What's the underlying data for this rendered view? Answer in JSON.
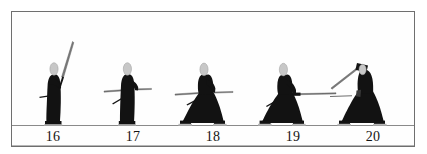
{
  "plate": {
    "title": "Kendo kata sequence plate",
    "frame_color": "#6f6f6f",
    "background_color": "#ffffff",
    "ground_line_color": "#8a8a8a",
    "figure_color": "#111111",
    "head_color": "#c9c9c9",
    "blade_color": "#6e6e6e"
  },
  "ground": {
    "label": "ground-line",
    "y": 125
  },
  "captions": [
    {
      "label": "16"
    },
    {
      "label": "17"
    },
    {
      "label": "18"
    },
    {
      "label": "19"
    },
    {
      "label": "20"
    }
  ],
  "figures": [
    {
      "number": "16",
      "pose": "standing, sword raised diagonally overhead to the right",
      "stance": "upright",
      "sword_angle_deg": -58,
      "center_x": 58
    },
    {
      "number": "17",
      "pose": "standing, sword held horizontally forward",
      "stance": "upright",
      "sword_angle_deg": 0,
      "center_x": 131
    },
    {
      "number": "18",
      "pose": "deep crouch, hakama spread, sword horizontal",
      "stance": "crouched",
      "sword_angle_deg": 0,
      "center_x": 206
    },
    {
      "number": "19",
      "pose": "deep crouch, arms extended forward with sword level",
      "stance": "crouched",
      "sword_angle_deg": 0,
      "center_x": 285
    },
    {
      "number": "20",
      "pose": "crouch, sword raised overhead angled down to the left",
      "stance": "crouched",
      "sword_angle_deg": 35,
      "center_x": 362
    }
  ]
}
